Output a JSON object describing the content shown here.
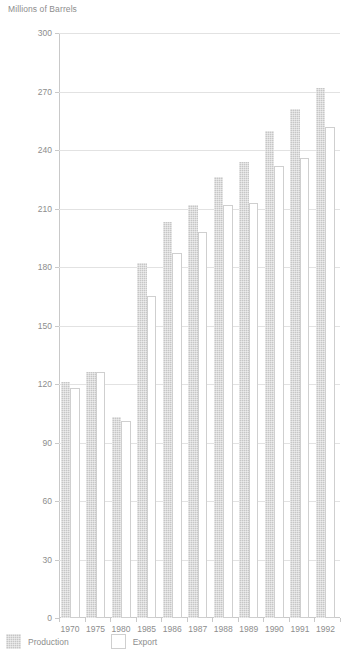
{
  "chart_data": {
    "type": "bar",
    "title": "",
    "ylabel": "Millions of Barrels",
    "xlabel": "",
    "ylim": [
      0,
      300
    ],
    "ytick_step": 30,
    "yticks": [
      "300",
      "270",
      "240",
      "210",
      "180",
      "150",
      "120",
      "90",
      "60",
      "30",
      "0"
    ],
    "grid": true,
    "legend_position": "bottom-left",
    "categories": [
      "1970",
      "1975",
      "1980",
      "1985",
      "1986",
      "1987",
      "1988",
      "1989",
      "1990",
      "1991",
      "1992"
    ],
    "series": [
      {
        "name": "Production",
        "color": "#c6c6c6",
        "values": [
          121,
          126,
          103,
          182,
          203,
          212,
          226,
          234,
          250,
          261,
          272
        ]
      },
      {
        "name": "Export",
        "color": "#ffffff",
        "values": [
          118,
          126,
          101,
          165,
          187,
          198,
          212,
          213,
          232,
          236,
          252
        ]
      }
    ]
  },
  "axis": {
    "y_title": "Millions of Barrels"
  },
  "legend": {
    "items": [
      {
        "label": "Production",
        "swatch": "filled-gray-swatch"
      },
      {
        "label": "Export",
        "swatch": "outlined-white-swatch"
      }
    ]
  },
  "colors": {
    "bar_production": "#c6c6c6",
    "bar_export": "#ffffff",
    "bar_export_border": "#cfcfcf",
    "gridline": "#e2e2e2",
    "axis": "#c9c9c9",
    "text": "#8d8d8d",
    "background": "#ffffff"
  }
}
